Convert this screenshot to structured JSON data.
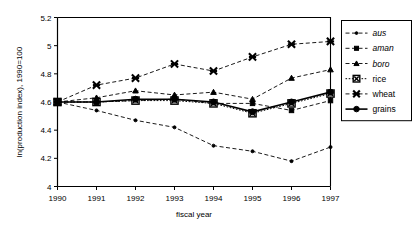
{
  "chart_data": {
    "type": "line",
    "title": "",
    "xlabel": "fiscal year",
    "ylabel": "ln(production index), 1990=100",
    "x": [
      1990,
      1991,
      1992,
      1993,
      1994,
      1995,
      1996,
      1997
    ],
    "xticklabels": [
      "1990",
      "1991",
      "1992",
      "1993",
      "1994",
      "1995",
      "1996",
      "1997"
    ],
    "yticklabels": [
      "4",
      "4.2",
      "4.4",
      "4.6",
      "4.8",
      "5",
      "5.2"
    ],
    "yticks": [
      4,
      4.2,
      4.4,
      4.6,
      4.8,
      5,
      5.2
    ],
    "xlim": [
      1990,
      1997
    ],
    "ylim": [
      4,
      5.2
    ],
    "grid": false,
    "legend_position": "right",
    "series": [
      {
        "name": "aus",
        "marker": "small-dot",
        "linestyle": "dashed",
        "italic": true,
        "values": [
          4.6,
          4.54,
          4.47,
          4.42,
          4.29,
          4.25,
          4.18,
          4.28
        ]
      },
      {
        "name": "aman",
        "marker": "small-square",
        "linestyle": "dashed",
        "italic": true,
        "values": [
          4.6,
          4.6,
          4.61,
          4.62,
          4.59,
          4.59,
          4.54,
          4.61
        ]
      },
      {
        "name": "boro",
        "marker": "small-triangle",
        "linestyle": "dashed",
        "italic": true,
        "values": [
          4.6,
          4.63,
          4.68,
          4.65,
          4.67,
          4.62,
          4.77,
          4.83
        ]
      },
      {
        "name": "rice",
        "marker": "square-x",
        "linestyle": "dotted",
        "italic": false,
        "values": [
          4.6,
          4.6,
          4.61,
          4.61,
          4.59,
          4.52,
          4.59,
          4.66
        ]
      },
      {
        "name": "wheat",
        "marker": "x-cross",
        "linestyle": "dashed",
        "italic": false,
        "values": [
          4.6,
          4.72,
          4.77,
          4.87,
          4.82,
          4.92,
          5.01,
          5.03
        ]
      },
      {
        "name": "grains",
        "marker": "filled-circle",
        "linestyle": "solid",
        "italic": false,
        "values": [
          4.6,
          4.6,
          4.62,
          4.62,
          4.6,
          4.53,
          4.6,
          4.67
        ]
      }
    ]
  },
  "legend": {
    "items": [
      {
        "label": "aus"
      },
      {
        "label": "aman"
      },
      {
        "label": "boro"
      },
      {
        "label": "rice"
      },
      {
        "label": "wheat"
      },
      {
        "label": "grains"
      }
    ]
  },
  "colors": {
    "ink": "#000000",
    "background": "#ffffff"
  }
}
